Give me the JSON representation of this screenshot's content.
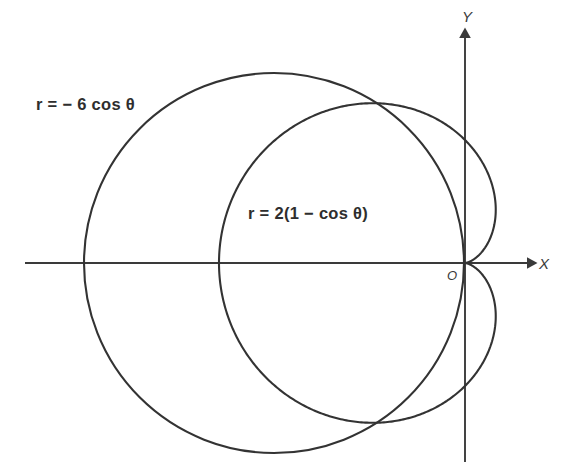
{
  "figure": {
    "title": "",
    "background_color": "#ffffff",
    "curve_color": "#333333",
    "axis_color": "#3a3a3a",
    "text_color": "#2e2e2e",
    "axes": {
      "x_label": "X",
      "y_label": "Y",
      "origin_label": "O",
      "x_arrow": "arrow-right",
      "y_arrow": "arrow-up"
    },
    "labels": {
      "circle": "r = − 6 cos θ",
      "cardioid": "r = 2(1 − cos θ)"
    }
  },
  "chart_data": {
    "type": "line",
    "title": "",
    "xlabel": "X",
    "ylabel": "Y",
    "coordinate_system": "polar",
    "grid": false,
    "legend": "inline-annotations",
    "origin_px": [
      465,
      263
    ],
    "units_per_px": 61.5,
    "xlim": [
      -7.2,
      1.6
    ],
    "ylim": [
      -3.2,
      3.9
    ],
    "series": [
      {
        "name": "r = − 6 cos θ",
        "equation": "r = -6*cos(theta)",
        "shape": "circle",
        "center_polar": [
          3,
          3.141592653589793
        ],
        "center_cartesian": [
          -3.106,
          0
        ],
        "radius": 3.09,
        "radius_px": 190,
        "center_px": [
          274,
          263
        ],
        "theta_range": [
          1.5707963267948966,
          4.71238898038469
        ],
        "passes_through_origin": true,
        "extremes": {
          "leftmost_px": [
            84,
            263
          ],
          "top_px": [
            274,
            73
          ],
          "bottom_px": [
            274,
            453
          ],
          "rightmost_px": [
            465,
            263
          ]
        }
      },
      {
        "name": "r = 2(1 − cos θ)",
        "equation": "r = 2*(1 - cos(theta))",
        "shape": "cardioid",
        "cusp_polar": [
          0,
          0
        ],
        "max_r": 4,
        "max_r_theta": 3.141592653589793,
        "scale_px_per_unit": 61.5,
        "theta_range": [
          0,
          6.283185307179586
        ],
        "extremes": {
          "leftmost_px": [
            219,
            263
          ],
          "top_px": [
            313,
            98
          ],
          "bottom_px": [
            313,
            428
          ],
          "rightmost_px": [
            487,
            205
          ]
        }
      }
    ],
    "intersections_px": [
      [
        373,
        100
      ],
      [
        377,
        428
      ],
      [
        465,
        263
      ]
    ],
    "annotations": [
      {
        "text": "r = − 6 cos θ",
        "px": [
          36,
          103
        ]
      },
      {
        "text": "r = 2(1 − cos θ)",
        "px": [
          248,
          212
        ]
      },
      {
        "text": "X",
        "px": [
          540,
          263
        ]
      },
      {
        "text": "Y",
        "px": [
          465,
          18
        ]
      },
      {
        "text": "O",
        "px": [
          452,
          278
        ]
      }
    ]
  }
}
